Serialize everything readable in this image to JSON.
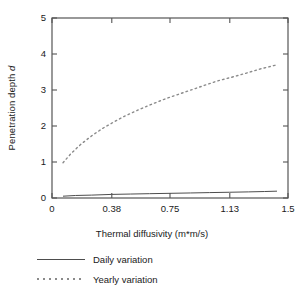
{
  "chart_data": {
    "type": "line",
    "title": "",
    "xlabel": "Thermal diffusivity (m*m/s)",
    "ylabel": "Penetration depth d",
    "ylabel_plain": "Penetration depth ",
    "ylabel_italic": "d",
    "xlim": [
      0,
      1.5
    ],
    "ylim": [
      0,
      5
    ],
    "grid": false,
    "legend_position": "below-axes-left",
    "xticks": [
      0,
      0.38,
      0.75,
      1.13,
      1.5
    ],
    "xticklabels": [
      "0",
      "0.38",
      "0.75",
      "1.13",
      "1.5"
    ],
    "yticks": [
      0,
      1,
      2,
      3,
      4,
      5
    ],
    "yticklabels": [
      "0",
      "1",
      "2",
      "3",
      "4",
      "5"
    ],
    "series": [
      {
        "name": "Daily variation",
        "style": "solid",
        "color": "#4d4d4d",
        "x": [
          0.07,
          0.15,
          0.25,
          0.38,
          0.5,
          0.62,
          0.75,
          0.88,
          1.0,
          1.13,
          1.25,
          1.35,
          1.43
        ],
        "values": [
          0.05,
          0.07,
          0.08,
          0.1,
          0.11,
          0.12,
          0.13,
          0.14,
          0.15,
          0.16,
          0.17,
          0.18,
          0.19
        ]
      },
      {
        "name": "Yearly variation",
        "style": "dotted",
        "color": "#8a8a8a",
        "x": [
          0.07,
          0.12,
          0.18,
          0.25,
          0.32,
          0.38,
          0.46,
          0.55,
          0.62,
          0.7,
          0.75,
          0.85,
          0.95,
          1.05,
          1.13,
          1.22,
          1.32,
          1.43
        ],
        "values": [
          0.98,
          1.23,
          1.48,
          1.72,
          1.93,
          2.08,
          2.27,
          2.45,
          2.58,
          2.72,
          2.8,
          2.95,
          3.1,
          3.25,
          3.34,
          3.45,
          3.58,
          3.7
        ]
      }
    ]
  },
  "legend": {
    "items": [
      {
        "label": "Daily variation",
        "style": "solid"
      },
      {
        "label": "Yearly variation",
        "style": "dotted"
      }
    ]
  }
}
